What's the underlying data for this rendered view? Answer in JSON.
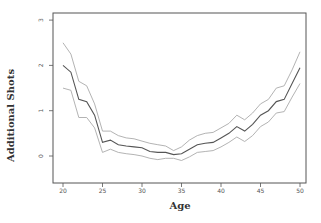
{
  "chart_data": {
    "type": "line",
    "title": "",
    "xlabel": "Age",
    "ylabel": "Additional Shots",
    "xlim": [
      19,
      51
    ],
    "ylim": [
      -0.6,
      3.15
    ],
    "xticks": [
      20,
      25,
      30,
      35,
      40,
      45,
      50
    ],
    "yticks": [
      0,
      1,
      2,
      3
    ],
    "grid": false,
    "legend": null,
    "x": [
      20,
      21,
      22,
      23,
      24,
      25,
      26,
      27,
      28,
      29,
      30,
      31,
      32,
      33,
      34,
      35,
      36,
      37,
      38,
      39,
      40,
      41,
      42,
      43,
      44,
      45,
      46,
      47,
      48,
      49,
      50
    ],
    "series": [
      {
        "name": "estimate",
        "color": "#555555",
        "values": [
          2.0,
          1.85,
          1.25,
          1.2,
          0.9,
          0.3,
          0.35,
          0.25,
          0.22,
          0.2,
          0.18,
          0.1,
          0.08,
          0.08,
          0.03,
          0.05,
          0.15,
          0.25,
          0.28,
          0.3,
          0.4,
          0.5,
          0.65,
          0.55,
          0.7,
          0.9,
          1.0,
          1.2,
          1.25,
          1.6,
          1.95
        ]
      },
      {
        "name": "upper band",
        "color": "#aaaaaa",
        "values": [
          2.5,
          2.25,
          1.65,
          1.55,
          1.15,
          0.55,
          0.55,
          0.45,
          0.4,
          0.38,
          0.33,
          0.28,
          0.25,
          0.22,
          0.12,
          0.2,
          0.35,
          0.45,
          0.5,
          0.52,
          0.62,
          0.72,
          0.9,
          0.8,
          0.95,
          1.15,
          1.25,
          1.5,
          1.55,
          1.9,
          2.3
        ]
      },
      {
        "name": "lower band",
        "color": "#aaaaaa",
        "values": [
          1.5,
          1.45,
          0.85,
          0.85,
          0.62,
          0.08,
          0.15,
          0.08,
          0.05,
          0.03,
          0.0,
          -0.05,
          -0.08,
          -0.05,
          -0.05,
          -0.1,
          -0.02,
          0.08,
          0.1,
          0.12,
          0.2,
          0.3,
          0.42,
          0.32,
          0.45,
          0.65,
          0.75,
          0.95,
          0.98,
          1.3,
          1.6
        ]
      }
    ]
  }
}
